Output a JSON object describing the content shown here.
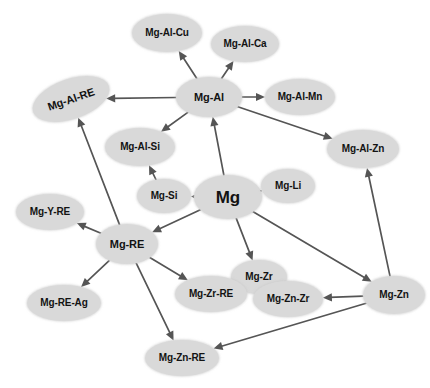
{
  "figure": {
    "type": "node-link-diagram",
    "background_color": "#ffffff",
    "node_fill_color": "#d9d9d9",
    "node_text_color": "#131313",
    "edge_color": "#555555"
  },
  "nodes": [
    {
      "id": "mg",
      "label": "Mg",
      "cx": 228,
      "cy": 197,
      "rx": 34,
      "ry": 22,
      "font_size": 17,
      "rotate": 0
    },
    {
      "id": "mg-al",
      "label": "Mg-Al",
      "cx": 209,
      "cy": 97,
      "rx": 33,
      "ry": 20,
      "font_size": 11,
      "rotate": 0
    },
    {
      "id": "mg-al-cu",
      "label": "Mg-Al-Cu",
      "cx": 167,
      "cy": 33,
      "rx": 35,
      "ry": 19,
      "font_size": 10,
      "rotate": 0
    },
    {
      "id": "mg-al-ca",
      "label": "Mg-Al-Ca",
      "cx": 245,
      "cy": 44,
      "rx": 34,
      "ry": 18,
      "font_size": 10,
      "rotate": 0
    },
    {
      "id": "mg-al-mn",
      "label": "Mg-Al-Mn",
      "cx": 300,
      "cy": 97,
      "rx": 35,
      "ry": 18,
      "font_size": 10,
      "rotate": 0
    },
    {
      "id": "mg-al-re",
      "label": "Mg-Al-RE",
      "cx": 71,
      "cy": 99,
      "rx": 40,
      "ry": 20,
      "font_size": 11,
      "rotate": -19
    },
    {
      "id": "mg-al-si",
      "label": "Mg-Al-Si",
      "cx": 140,
      "cy": 147,
      "rx": 35,
      "ry": 19,
      "font_size": 10,
      "rotate": 0
    },
    {
      "id": "mg-al-zn",
      "label": "Mg-Al-Zn",
      "cx": 363,
      "cy": 149,
      "rx": 36,
      "ry": 19,
      "font_size": 10,
      "rotate": 0
    },
    {
      "id": "mg-si",
      "label": "Mg-Si",
      "cx": 164,
      "cy": 196,
      "rx": 27,
      "ry": 17,
      "font_size": 10,
      "rotate": 0
    },
    {
      "id": "mg-li",
      "label": "Mg-Li",
      "cx": 288,
      "cy": 186,
      "rx": 27,
      "ry": 17,
      "font_size": 10,
      "rotate": 0
    },
    {
      "id": "mg-y-re",
      "label": "Mg-Y-RE",
      "cx": 50,
      "cy": 212,
      "rx": 34,
      "ry": 18,
      "font_size": 10,
      "rotate": 0
    },
    {
      "id": "mg-re",
      "label": "Mg-RE",
      "cx": 127,
      "cy": 244,
      "rx": 31,
      "ry": 20,
      "font_size": 11,
      "rotate": 0
    },
    {
      "id": "mg-re-ag",
      "label": "Mg-RE-Ag",
      "cx": 64,
      "cy": 303,
      "rx": 37,
      "ry": 18,
      "font_size": 10,
      "rotate": 0
    },
    {
      "id": "mg-zr",
      "label": "Mg-Zr",
      "cx": 259,
      "cy": 277,
      "rx": 28,
      "ry": 17,
      "font_size": 10,
      "rotate": 0
    },
    {
      "id": "mg-zr-re",
      "label": "Mg-Zr-RE",
      "cx": 211,
      "cy": 294,
      "rx": 36,
      "ry": 18,
      "font_size": 10,
      "rotate": 0
    },
    {
      "id": "mg-zn-zr",
      "label": "Mg-Zn-Zr",
      "cx": 288,
      "cy": 299,
      "rx": 35,
      "ry": 18,
      "font_size": 10,
      "rotate": 0
    },
    {
      "id": "mg-zn",
      "label": "Mg-Zn",
      "cx": 394,
      "cy": 295,
      "rx": 31,
      "ry": 19,
      "font_size": 10,
      "rotate": 0
    },
    {
      "id": "mg-zn-re",
      "label": "Mg-Zn-RE",
      "cx": 182,
      "cy": 358,
      "rx": 37,
      "ry": 18,
      "font_size": 10,
      "rotate": 0
    }
  ],
  "edges": [
    {
      "from": "mg",
      "to": "mg-al",
      "arrow": true
    },
    {
      "from": "mg",
      "to": "mg-si",
      "arrow": true
    },
    {
      "from": "mg",
      "to": "mg-li",
      "arrow": true
    },
    {
      "from": "mg",
      "to": "mg-re",
      "arrow": true
    },
    {
      "from": "mg",
      "to": "mg-zr",
      "arrow": true
    },
    {
      "from": "mg",
      "to": "mg-zn",
      "arrow": true
    },
    {
      "from": "mg-al",
      "to": "mg-al-cu",
      "arrow": true
    },
    {
      "from": "mg-al",
      "to": "mg-al-ca",
      "arrow": true
    },
    {
      "from": "mg-al",
      "to": "mg-al-mn",
      "arrow": true
    },
    {
      "from": "mg-al",
      "to": "mg-al-re",
      "arrow": true
    },
    {
      "from": "mg-al",
      "to": "mg-al-si",
      "arrow": true
    },
    {
      "from": "mg-al",
      "to": "mg-al-zn",
      "arrow": true
    },
    {
      "from": "mg-si",
      "to": "mg-al-si",
      "arrow": true
    },
    {
      "from": "mg-re",
      "to": "mg-al-re",
      "arrow": true
    },
    {
      "from": "mg-re",
      "to": "mg-y-re",
      "arrow": true
    },
    {
      "from": "mg-re",
      "to": "mg-re-ag",
      "arrow": true
    },
    {
      "from": "mg-re",
      "to": "mg-zr-re",
      "arrow": true
    },
    {
      "from": "mg-re",
      "to": "mg-zn-re",
      "arrow": true
    },
    {
      "from": "mg-zr",
      "to": "mg-zr-re",
      "arrow": true
    },
    {
      "from": "mg-zr",
      "to": "mg-zn-zr",
      "arrow": true
    },
    {
      "from": "mg-zn",
      "to": "mg-zn-zr",
      "arrow": true
    },
    {
      "from": "mg-zn",
      "to": "mg-zn-re",
      "arrow": true
    },
    {
      "from": "mg-zn",
      "to": "mg-al-zn",
      "arrow": true
    }
  ]
}
